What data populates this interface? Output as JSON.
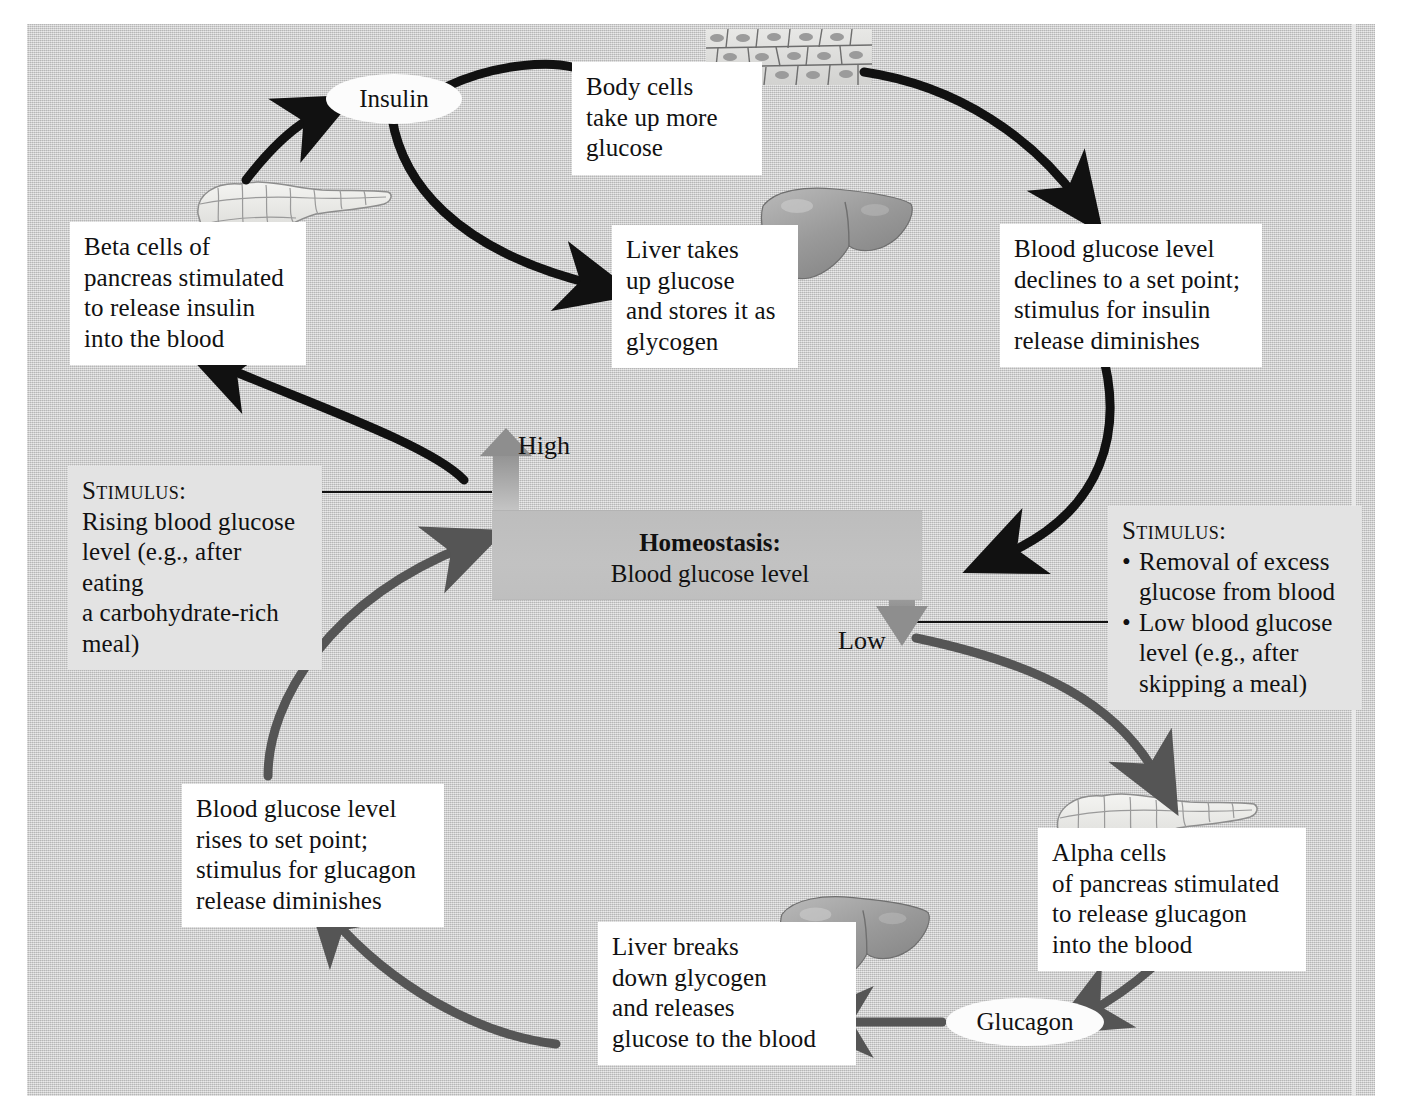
{
  "figure": {
    "background_color": "#c8c8c8",
    "insulin_loop_arrow_color": "#111111",
    "glucagon_loop_arrow_color": "#555555",
    "homeostasis_bar_color": "#c0c0c0"
  },
  "center": {
    "homeostasis_label": "Homeostasis:",
    "homeostasis_variable": "Blood glucose level",
    "high_label": "High",
    "low_label": "Low"
  },
  "hormones": {
    "insulin": "Insulin",
    "glucagon": "Glucagon"
  },
  "stimulus_left": {
    "heading": "Stimulus:",
    "line1": "Rising blood glucose",
    "line2": "level (e.g., after eating",
    "line3": "a carbohydrate-rich",
    "line4": "meal)"
  },
  "stimulus_right": {
    "heading": "Stimulus:",
    "bullet1_line1": "Removal of excess",
    "bullet1_line2": "glucose from blood",
    "bullet2_line1": "Low blood glucose",
    "bullet2_line2": "level (e.g., after",
    "bullet2_line3": "skipping a meal)"
  },
  "insulin_loop": {
    "beta_cells": {
      "line1": "Beta cells of",
      "line2": "pancreas stimulated",
      "line3": "to release insulin",
      "line4": "into the blood"
    },
    "body_cells": {
      "line1": "Body cells",
      "line2": "take up more",
      "line3": "glucose"
    },
    "liver_uptake": {
      "line1": "Liver takes",
      "line2": "up glucose",
      "line3": "and stores it as",
      "line4": "glycogen"
    },
    "glucose_declines": {
      "line1": "Blood glucose level",
      "line2": "declines to a set point;",
      "line3": "stimulus for insulin",
      "line4": "release diminishes"
    }
  },
  "glucagon_loop": {
    "alpha_cells": {
      "line1": "Alpha cells",
      "line2": "of pancreas stimulated",
      "line3": "to release glucagon",
      "line4": "into the blood"
    },
    "liver_breakdown": {
      "line1": "Liver breaks",
      "line2": "down glycogen",
      "line3": "and releases",
      "line4": "glucose to the blood"
    },
    "glucose_rises": {
      "line1": "Blood glucose level",
      "line2": "rises to set point;",
      "line3": "stimulus for glucagon",
      "line4": "release diminishes"
    }
  },
  "illustrations": {
    "pancreas_top": "pancreas-illustration",
    "pancreas_bottom": "pancreas-illustration",
    "liver_top": "liver-illustration",
    "liver_bottom": "liver-illustration",
    "body_cells_tissue": "epithelial-tissue-illustration"
  }
}
